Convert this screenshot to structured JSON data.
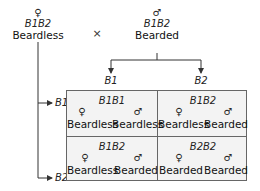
{
  "cross": {
    "operator": "×",
    "female_parent": {
      "symbol": "♀",
      "genotype": "B1B2",
      "phenotype": "Beardless"
    },
    "male_parent": {
      "symbol": "♂",
      "genotype": "B1B2",
      "phenotype": "Bearded"
    }
  },
  "gametes": {
    "male": [
      "B1",
      "B2"
    ],
    "female": [
      "B1",
      "B2"
    ]
  },
  "punnett": {
    "cells": [
      {
        "genotype": "B1B1",
        "female": {
          "symbol": "♀",
          "phenotype": "Beardless"
        },
        "male": {
          "symbol": "♂",
          "phenotype": "Beardless"
        }
      },
      {
        "genotype": "B1B2",
        "female": {
          "symbol": "♀",
          "phenotype": "Beardless"
        },
        "male": {
          "symbol": "♂",
          "phenotype": "Bearded"
        }
      },
      {
        "genotype": "B1B2",
        "female": {
          "symbol": "♀",
          "phenotype": "Beardless"
        },
        "male": {
          "symbol": "♂",
          "phenotype": "Bearded"
        }
      },
      {
        "genotype": "B2B2",
        "female": {
          "symbol": "♀",
          "phenotype": "Bearded"
        },
        "male": {
          "symbol": "♂",
          "phenotype": "Bearded"
        }
      }
    ]
  },
  "colors": {
    "line": "#333333",
    "grid_border": "#666666",
    "grid_fill": "#f3f3f3"
  }
}
